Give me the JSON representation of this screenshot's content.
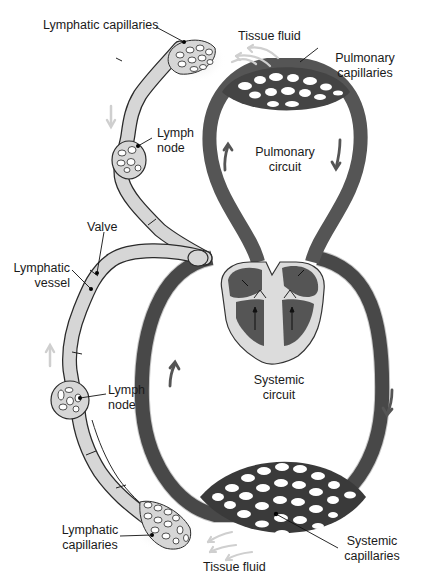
{
  "diagram": {
    "colors": {
      "blood_vessel": "#555555",
      "lymph_vessel": "#d6d6d6",
      "outline": "#2a2a2a",
      "arrow_light": "#cfcfcf",
      "arrow_dark": "#555555",
      "heart_fill": "#dcdcdc"
    },
    "labels": {
      "lymphatic_capillaries_top": "Lymphatic capillaries",
      "tissue_fluid_top": "Tissue fluid",
      "pulmonary_capillaries": [
        "Pulmonary",
        "capillaries"
      ],
      "lymph_node_top": [
        "Lymph",
        "node"
      ],
      "pulmonary_circuit": [
        "Pulmonary",
        "circuit"
      ],
      "valve": "Valve",
      "lymphatic_vessel": [
        "Lymphatic",
        "vessel"
      ],
      "systemic_circuit": [
        "Systemic",
        "circuit"
      ],
      "lymph_node_bottom": [
        "Lymph",
        "node"
      ],
      "lymphatic_capillaries_bottom": [
        "Lymphatic",
        "capillaries"
      ],
      "systemic_capillaries": [
        "Systemic",
        "capillaries"
      ],
      "tissue_fluid_bottom": "Tissue fluid"
    }
  }
}
